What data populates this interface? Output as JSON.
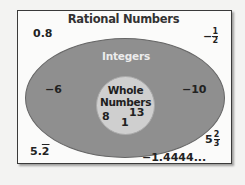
{
  "diagram": {
    "type": "venn-nested",
    "title": "Rational Numbers",
    "sets": [
      {
        "name": "Rational Numbers",
        "role": "outer-rectangle"
      },
      {
        "name": "Integers",
        "role": "middle-ellipse"
      },
      {
        "name": "Whole Numbers",
        "role": "inner-circle",
        "lines": [
          "Whole",
          "Numbers"
        ]
      }
    ],
    "rational_only": {
      "zero_point_eight": "0.8",
      "neg_half": {
        "sign": "−",
        "numerator": "1",
        "denominator": "2"
      },
      "five_point_two_repeat": {
        "base": "5.",
        "repeating": "2"
      },
      "five_two_thirds": {
        "whole": "5",
        "numerator": "2",
        "denominator": "3"
      },
      "neg_one_point_four": "−1.4444..."
    },
    "integers_only": [
      "−6",
      "−10"
    ],
    "whole_numbers": [
      "8",
      "1",
      "13"
    ]
  },
  "colors": {
    "background": "#f3f3f2",
    "frame_border": "#3a3a3a",
    "integers_fill": "#8f8f8f",
    "whole_fill": "#cfcfcf",
    "integers_label": "#ececec"
  }
}
